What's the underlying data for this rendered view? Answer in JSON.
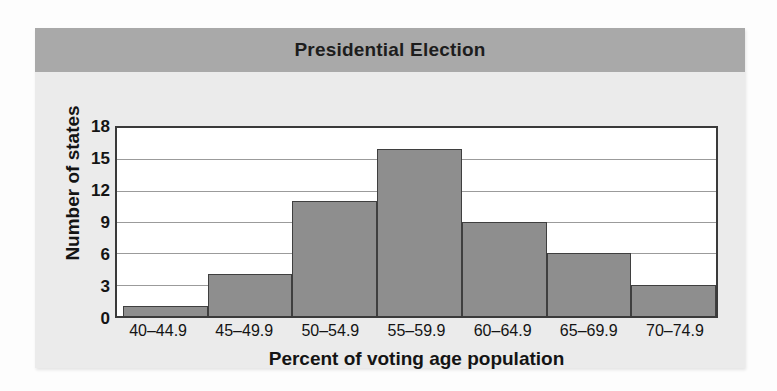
{
  "figure": {
    "title": "Presidential Election",
    "band_color": "#a9a9a9",
    "card_background": "#ebebeb",
    "bar_color": "#8e8e8e",
    "bar_outline_color": "#3f3f3f",
    "plot_background": "#ffffff",
    "gridline_color": "#9b9b9b"
  },
  "chart_data": {
    "type": "bar",
    "title": "Presidential Election",
    "subtitle": "",
    "xlabel": "Percent of voting age population",
    "ylabel": "Number of states",
    "categories": [
      "40–44.9",
      "45–49.9",
      "50–54.9",
      "55–59.9",
      "60–64.9",
      "65–69.9",
      "70–74.9"
    ],
    "values": [
      1,
      4,
      11,
      16,
      9,
      6,
      3
    ],
    "ylim": [
      0,
      18
    ],
    "yticks": [
      0,
      3,
      6,
      9,
      12,
      15,
      18
    ],
    "ytick_labels": [
      "0",
      "3",
      "6",
      "9",
      "12",
      "15",
      "18"
    ],
    "grid": true,
    "grid_axis": "y",
    "legend": false,
    "legend_position": "none",
    "bar_gap": 0,
    "annotations": []
  }
}
